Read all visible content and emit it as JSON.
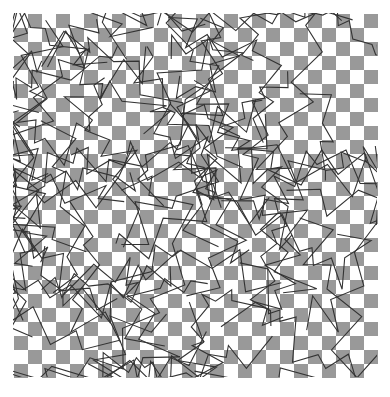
{
  "figure": {
    "title": "Checkerboard texture with overlaid random zigzag polylines",
    "type": "raster-texture",
    "canvas": {
      "width": 390,
      "height": 397,
      "background_color": "#ffffff"
    },
    "pattern_area": {
      "x": 14,
      "y": 14,
      "width": 362,
      "height": 362
    },
    "checkerboard": {
      "cell_size": 14,
      "columns": 26,
      "rows": 26,
      "light_color": "#ffffff",
      "dark_color": "#999999",
      "origin_cell_is_light": true,
      "phase_note": "cell (col+row) even renders light, odd renders dark"
    },
    "overlay_lines": {
      "stroke_color": "#333333",
      "stroke_width": 1.1,
      "stroke_linejoin": "miter",
      "stroke_linecap": "butt",
      "fill": "none",
      "path_count": 58,
      "vertices_per_path_min": 9,
      "vertices_per_path_max": 18,
      "style": "random zigzag polyline",
      "seed": 20240917,
      "step_min": 10,
      "step_max": 46
    },
    "clipping": {
      "enabled": true,
      "note": "lines are clipped to the pattern area with a small bleed"
    },
    "observed_colors": {
      "background": "#ffffff",
      "checker_gray": "#999999",
      "line_dark": "#333333"
    }
  }
}
